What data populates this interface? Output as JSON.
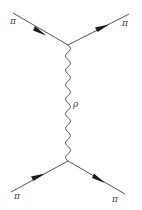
{
  "diagram": {
    "type": "feynman",
    "title": "",
    "vertices": [
      {
        "id": "top",
        "x": 68,
        "y": 45
      },
      {
        "id": "bottom",
        "x": 68,
        "y": 161
      }
    ],
    "external_lines": [
      {
        "id": "top-left",
        "label": "π",
        "from": [
          13,
          13
        ],
        "to": [
          68,
          45
        ],
        "direction": "in",
        "label_pos": [
          10,
          24
        ]
      },
      {
        "id": "top-right",
        "label": "π",
        "from": [
          68,
          45
        ],
        "to": [
          129,
          14
        ],
        "direction": "out",
        "label_pos": [
          122,
          26
        ]
      },
      {
        "id": "bottom-left",
        "label": "π",
        "from": [
          11,
          192
        ],
        "to": [
          68,
          161
        ],
        "direction": "in",
        "label_pos": [
          14,
          198
        ]
      },
      {
        "id": "bottom-right",
        "label": "π",
        "from": [
          68,
          161
        ],
        "to": [
          125,
          194
        ],
        "direction": "out",
        "label_pos": [
          112,
          201
        ]
      }
    ],
    "propagator": {
      "label": "ρ",
      "style": "wavy",
      "from": [
        68,
        45
      ],
      "to": [
        68,
        161
      ],
      "label_pos": [
        73,
        106
      ]
    },
    "colors": {
      "line": "#555555",
      "arrow": "#1a1a1a",
      "label": "#444444",
      "background": "#ffffff"
    }
  }
}
